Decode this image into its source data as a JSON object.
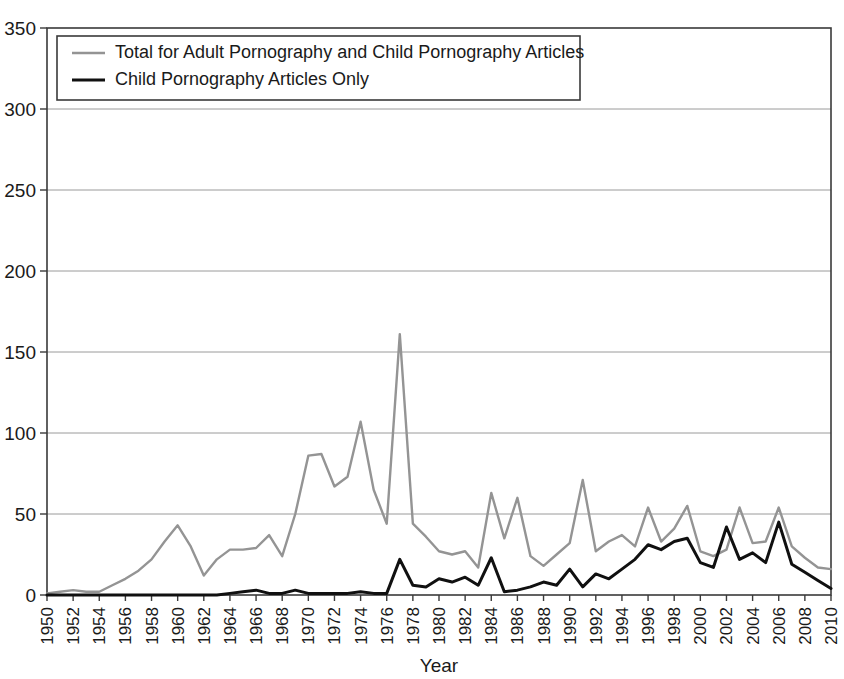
{
  "chart_data": {
    "type": "line",
    "title": "",
    "xlabel": "Year",
    "ylabel": "",
    "xlim": [
      1950,
      2010
    ],
    "ylim": [
      0,
      350
    ],
    "ytick_step": 50,
    "xtick_step": 2,
    "grid": true,
    "legend_position": "top-left",
    "ytick_labels": [
      "0",
      "50",
      "100",
      "150",
      "200",
      "250",
      "300",
      "350"
    ],
    "ytick_values": [
      0,
      50,
      100,
      150,
      200,
      250,
      300,
      350
    ],
    "xtick_labels": [
      "1950",
      "1952",
      "1954",
      "1956",
      "1958",
      "1960",
      "1962",
      "1964",
      "1966",
      "1968",
      "1970",
      "1972",
      "1974",
      "1976",
      "1978",
      "1980",
      "1982",
      "1984",
      "1986",
      "1988",
      "1990",
      "1992",
      "1994",
      "1996",
      "1998",
      "2000",
      "2002",
      "2004",
      "2006",
      "2008",
      "2010"
    ],
    "x": [
      1950,
      1951,
      1952,
      1953,
      1954,
      1955,
      1956,
      1957,
      1958,
      1959,
      1960,
      1961,
      1962,
      1963,
      1964,
      1965,
      1966,
      1967,
      1968,
      1969,
      1970,
      1971,
      1972,
      1973,
      1974,
      1975,
      1976,
      1977,
      1978,
      1979,
      1980,
      1981,
      1982,
      1983,
      1984,
      1985,
      1986,
      1987,
      1988,
      1989,
      1990,
      1991,
      1992,
      1993,
      1994,
      1995,
      1996,
      1997,
      1998,
      1999,
      2000,
      2001,
      2002,
      2003,
      2004,
      2005,
      2006,
      2007,
      2008,
      2009,
      2010
    ],
    "series": [
      {
        "name": "Total for Adult Pornography and Child Pornography Articles",
        "color": "#949494",
        "values": [
          1,
          2,
          3,
          2,
          2,
          6,
          10,
          15,
          22,
          33,
          43,
          30,
          12,
          22,
          28,
          28,
          29,
          37,
          24,
          50,
          86,
          87,
          67,
          73,
          107,
          65,
          44,
          161,
          44,
          36,
          27,
          25,
          27,
          17,
          63,
          35,
          60,
          24,
          18,
          25,
          32,
          71,
          27,
          33,
          37,
          30,
          54,
          33,
          41,
          55,
          27,
          24,
          28,
          54,
          32,
          33,
          54,
          30,
          23,
          17,
          16
        ]
      },
      {
        "name": "Child Pornography Articles Only",
        "color": "#101010",
        "values": [
          0,
          0,
          0,
          0,
          0,
          0,
          0,
          0,
          0,
          0,
          0,
          0,
          0,
          0,
          1,
          2,
          3,
          1,
          1,
          3,
          1,
          1,
          1,
          1,
          2,
          1,
          1,
          22,
          6,
          5,
          10,
          8,
          11,
          6,
          23,
          2,
          3,
          5,
          8,
          6,
          16,
          5,
          13,
          10,
          16,
          22,
          31,
          28,
          33,
          35,
          20,
          17,
          42,
          22,
          26,
          20,
          45,
          19,
          14,
          9,
          4
        ]
      }
    ],
    "legend": [
      {
        "label": "Total for Adult Pornography and Child Pornography Articles",
        "color": "#949494"
      },
      {
        "label": "Child Pornography Articles Only",
        "color": "#101010"
      }
    ]
  }
}
